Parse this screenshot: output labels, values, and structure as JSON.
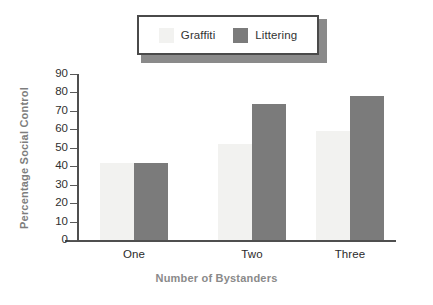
{
  "legend": {
    "entries": [
      {
        "label": "Graffiti",
        "color": "#f2f2f0",
        "swatch_name": "graffiti-swatch"
      },
      {
        "label": "Littering",
        "color": "#7b7b7b",
        "swatch_name": "littering-swatch"
      }
    ]
  },
  "chart_data": {
    "type": "bar",
    "title": "",
    "xlabel": "Number of Bystanders",
    "ylabel": "Percentage Social Control",
    "categories": [
      "One",
      "Two",
      "Three"
    ],
    "series": [
      {
        "name": "Graffiti",
        "color": "#f2f2f0",
        "values": [
          42,
          52,
          59
        ]
      },
      {
        "name": "Littering",
        "color": "#7b7b7b",
        "values": [
          42,
          74,
          78
        ]
      }
    ],
    "ylim": [
      0,
      90
    ],
    "ytick_step": 10,
    "yticks": [
      0,
      10,
      20,
      30,
      40,
      50,
      60,
      70,
      80,
      90
    ],
    "ytick_labels": [
      "0",
      "10",
      "20",
      "30",
      "40",
      "50",
      "60",
      "70",
      "80",
      "90"
    ],
    "grid": false,
    "legend_position": "top-center"
  }
}
